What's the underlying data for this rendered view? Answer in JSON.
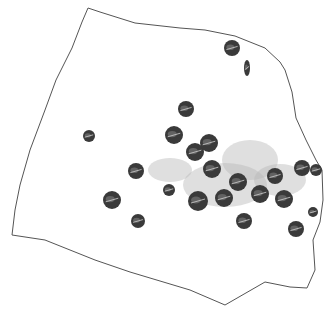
{
  "figure": {
    "background": "#ffffff",
    "outline_color": "#555555",
    "stain_color": "#b9b9b9",
    "seed_color": "#3a3a3a",
    "outline_points": "88,8 100,12 135,23 180,28 205,30 235,36 265,48 280,62 285,70 292,92 296,118 306,140 316,160 322,170 323,200 320,222 313,240 315,270 307,288 290,287 265,282 225,305 190,290 130,272 95,260 45,240 12,235 15,210 20,185 30,150 45,110 56,80 72,48 82,22",
    "stains": [
      {
        "cx": 250,
        "cy": 160,
        "rx": 28,
        "ry": 20
      },
      {
        "cx": 225,
        "cy": 185,
        "rx": 42,
        "ry": 22
      },
      {
        "cx": 280,
        "cy": 180,
        "rx": 26,
        "ry": 16
      },
      {
        "cx": 170,
        "cy": 170,
        "rx": 22,
        "ry": 12
      }
    ],
    "seeds": [
      {
        "cx": 232,
        "cy": 48,
        "r": 8
      },
      {
        "cx": 247,
        "cy": 68,
        "rx": 3,
        "ry": 8
      },
      {
        "cx": 186,
        "cy": 109,
        "r": 8
      },
      {
        "cx": 89,
        "cy": 136,
        "r": 6
      },
      {
        "cx": 174,
        "cy": 135,
        "r": 9
      },
      {
        "cx": 195,
        "cy": 152,
        "r": 9
      },
      {
        "cx": 209,
        "cy": 143,
        "r": 9
      },
      {
        "cx": 136,
        "cy": 171,
        "r": 8
      },
      {
        "cx": 212,
        "cy": 169,
        "r": 9
      },
      {
        "cx": 238,
        "cy": 182,
        "r": 9
      },
      {
        "cx": 275,
        "cy": 176,
        "r": 8
      },
      {
        "cx": 302,
        "cy": 168,
        "r": 8
      },
      {
        "cx": 316,
        "cy": 170,
        "r": 6
      },
      {
        "cx": 112,
        "cy": 200,
        "r": 9
      },
      {
        "cx": 169,
        "cy": 190,
        "r": 6
      },
      {
        "cx": 198,
        "cy": 201,
        "r": 10
      },
      {
        "cx": 224,
        "cy": 198,
        "r": 9
      },
      {
        "cx": 260,
        "cy": 194,
        "r": 9
      },
      {
        "cx": 284,
        "cy": 199,
        "r": 9
      },
      {
        "cx": 138,
        "cy": 221,
        "r": 7
      },
      {
        "cx": 244,
        "cy": 221,
        "r": 8
      },
      {
        "cx": 296,
        "cy": 229,
        "r": 8
      },
      {
        "cx": 313,
        "cy": 212,
        "r": 5
      }
    ]
  }
}
